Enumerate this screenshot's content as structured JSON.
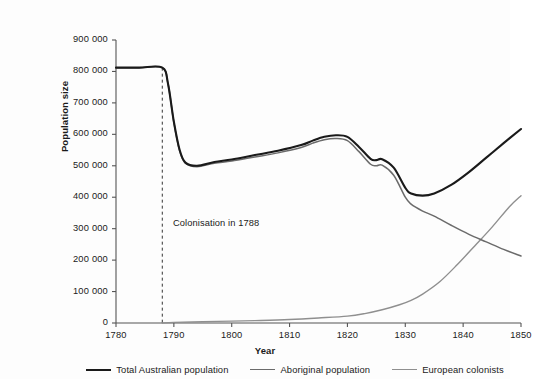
{
  "chart_data": {
    "type": "line",
    "title": "",
    "xlabel": "Year",
    "ylabel": "Population size",
    "xlim": [
      1780,
      1850
    ],
    "ylim": [
      0,
      900000
    ],
    "grid": false,
    "legend_position": "bottom",
    "x_ticks": [
      "1780",
      "1790",
      "1800",
      "1810",
      "1820",
      "1830",
      "1840",
      "1850"
    ],
    "y_ticks": [
      "0",
      "100 000",
      "200 000",
      "300 000",
      "400 000",
      "500 000",
      "600 000",
      "700 000",
      "800 000",
      "900 000"
    ],
    "annotations": [
      {
        "text": "Colonisation in 1788",
        "x": 1788,
        "style": "dashed-vertical-line"
      }
    ],
    "series": [
      {
        "name": "Total Australian population",
        "color": "#1a1a1a",
        "x": [
          1780,
          1784,
          1788,
          1789,
          1790,
          1791,
          1792,
          1794,
          1797,
          1800,
          1804,
          1808,
          1812,
          1814,
          1816,
          1818,
          1820,
          1822,
          1824,
          1825,
          1826,
          1828,
          1830,
          1831,
          1833,
          1835,
          1838,
          1841,
          1844,
          1847,
          1850
        ],
        "values": [
          812000,
          812000,
          812000,
          760000,
          640000,
          550000,
          510000,
          500000,
          512000,
          520000,
          534000,
          548000,
          566000,
          580000,
          592000,
          597000,
          592000,
          560000,
          522000,
          518000,
          521000,
          494000,
          430000,
          412000,
          405000,
          412000,
          440000,
          480000,
          526000,
          572000,
          617000
        ]
      },
      {
        "name": "Aboriginal population",
        "color": "#6b6b6b",
        "x": [
          1780,
          1784,
          1788,
          1789,
          1790,
          1791,
          1792,
          1794,
          1797,
          1800,
          1804,
          1808,
          1812,
          1814,
          1816,
          1818,
          1820,
          1822,
          1824,
          1825,
          1826,
          1828,
          1830,
          1831,
          1833,
          1835,
          1838,
          1841,
          1844,
          1847,
          1850
        ],
        "values": [
          812000,
          812000,
          812000,
          760000,
          638000,
          548000,
          508000,
          497000,
          508000,
          515000,
          528000,
          541000,
          558000,
          572000,
          583000,
          587000,
          580000,
          545000,
          505000,
          500000,
          502000,
          470000,
          400000,
          378000,
          356000,
          340000,
          310000,
          282000,
          258000,
          234000,
          213000
        ]
      },
      {
        "name": "European colonists",
        "color": "#8f8f8f",
        "x": [
          1788,
          1790,
          1795,
          1800,
          1805,
          1810,
          1815,
          1820,
          1823,
          1826,
          1829,
          1831,
          1833,
          1836,
          1839,
          1842,
          1845,
          1848,
          1850
        ],
        "values": [
          0,
          2000,
          4000,
          6000,
          8000,
          11000,
          16000,
          22000,
          30000,
          42000,
          58000,
          72000,
          92000,
          132000,
          186000,
          245000,
          305000,
          370000,
          405000
        ]
      }
    ]
  },
  "legend": {
    "items": [
      {
        "label": "Total Australian population",
        "color": "#1a1a1a",
        "width": "2.1px"
      },
      {
        "label": "Aboriginal population",
        "color": "#6b6b6b",
        "width": "1.5px"
      },
      {
        "label": "European colonists",
        "color": "#8f8f8f",
        "width": "1.4px"
      }
    ]
  },
  "axes": {
    "axis_color": "#555555"
  }
}
